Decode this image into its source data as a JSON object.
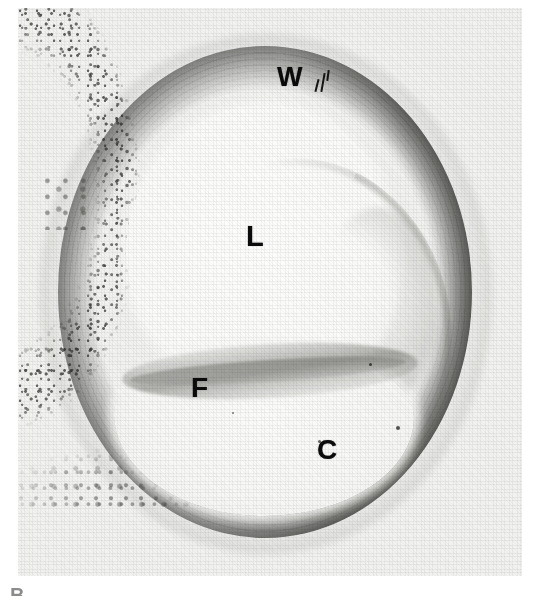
{
  "figure": {
    "panel_letter": "B",
    "caption_alt": "Histologic cross-section of an artery showing true lumen, intimal flap, false channel and vessel wall",
    "background_color": "#ffffff",
    "plate_color": "#f2f2f0",
    "ink_color": "#0b0b0b"
  },
  "labels": {
    "wall": "W",
    "lumen": "L",
    "flap": "F",
    "channel": "C"
  },
  "label_meanings": {
    "wall": "vessel wall",
    "lumen": "true lumen",
    "flap": "intimal flap",
    "channel": "false channel"
  },
  "regions": {
    "true_lumen": "true-lumen",
    "false_lumen": "false-lumen",
    "intimal_flap": "intimal-flap",
    "vessel_wall": "vessel-wall-ring",
    "adventitia": "adventitia"
  }
}
